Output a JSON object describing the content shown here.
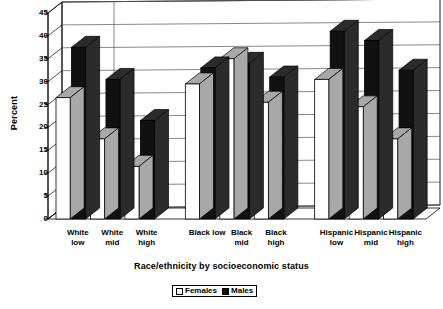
{
  "chart_data": {
    "type": "bar",
    "title": "",
    "xlabel": "Race/ethnicity by socioeconomic status",
    "ylabel": "Percent",
    "ylim": [
      0,
      45
    ],
    "ytick_step": 5,
    "yticks": [
      0,
      5,
      10,
      15,
      20,
      25,
      30,
      35,
      40,
      45
    ],
    "grid": true,
    "legend_position": "bottom",
    "style": "3d-column",
    "categories": [
      "White low",
      "White mid",
      "White high",
      "Black low",
      "Black mid",
      "Black high",
      "Hispanic low",
      "Hispanic mid",
      "Hispanic high"
    ],
    "category_lines": [
      [
        "White",
        "low"
      ],
      [
        "White",
        "mid"
      ],
      [
        "White",
        "high"
      ],
      [
        "Black low",
        ""
      ],
      [
        "Black",
        "mid"
      ],
      [
        "Black",
        "high"
      ],
      [
        "Hispanic",
        "low"
      ],
      [
        "Hispanic",
        "mid"
      ],
      [
        "Hispanic",
        "high"
      ]
    ],
    "series": [
      {
        "name": "Females",
        "color": "#ffffff",
        "values": [
          26.5,
          17.5,
          11.5,
          29.5,
          35.0,
          25.5,
          30.5,
          24.5,
          17.5
        ]
      },
      {
        "name": "Males",
        "color": "#111111",
        "values": [
          37.5,
          30.5,
          21.5,
          33.0,
          34.0,
          31.0,
          41.0,
          39.0,
          32.5
        ]
      }
    ]
  },
  "legend": {
    "items": [
      {
        "label": "Females",
        "swatch": "white-square-icon"
      },
      {
        "label": "Males",
        "swatch": "black-square-icon"
      }
    ]
  },
  "axes": {
    "y_title": "Percent",
    "x_title": "Race/ethnicity by socioeconomic status",
    "y_tick_labels": [
      "45",
      "40",
      "35",
      "30",
      "25",
      "20",
      "15",
      "10",
      "5",
      "0"
    ]
  },
  "colors": {
    "bar_female_face": "#ffffff",
    "bar_female_side": "#a8a8a8",
    "bar_male_face": "#111111",
    "bar_male_side": "#2b2b2b",
    "outline": "#000000",
    "gridline": "#555555",
    "floor": "#ffffff",
    "background": "#ffffff"
  }
}
